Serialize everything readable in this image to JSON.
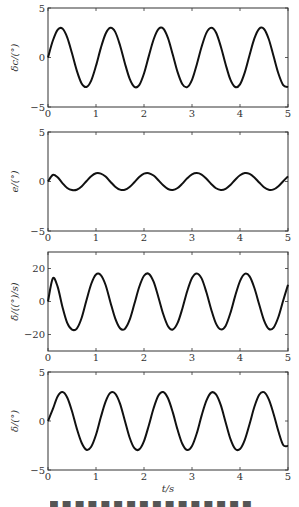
{
  "chart_data": [
    {
      "type": "line",
      "ylabel": "δc/(°)",
      "xlabel": "",
      "xlim": [
        0,
        5
      ],
      "ylim": [
        -5,
        5
      ],
      "xticks": [
        0,
        1,
        2,
        3,
        4,
        5
      ],
      "yticks": [
        -5,
        0,
        5
      ],
      "grid": false,
      "series": [
        {
          "name": "delta_c",
          "x": [
            0,
            0.1,
            0.2,
            0.3,
            0.4,
            0.5,
            0.6,
            0.7,
            0.8,
            0.9,
            1.0,
            1.1,
            1.2,
            1.3,
            1.4,
            1.5,
            1.6,
            1.7,
            1.8,
            1.9,
            2.0,
            2.1,
            2.2,
            2.3,
            2.4,
            2.5,
            2.6,
            2.7,
            2.8,
            2.9,
            3.0,
            3.1,
            3.2,
            3.3,
            3.4,
            3.5,
            3.6,
            3.7,
            3.8,
            3.9,
            4.0,
            4.1,
            4.2,
            4.3,
            4.4,
            4.5,
            4.6,
            4.7,
            4.8,
            4.9,
            5.0
          ],
          "y": [
            0,
            1.69,
            2.8,
            2.92,
            2.03,
            0.42,
            -1.33,
            -2.62,
            -2.98,
            -2.33,
            -0.84,
            0.95,
            2.4,
            3.0,
            2.59,
            1.24,
            -0.55,
            -2.13,
            -2.96,
            -2.79,
            -1.61,
            0.14,
            1.82,
            2.86,
            2.93,
            1.96,
            0.28,
            -1.48,
            -2.7,
            -2.99,
            -2.26,
            -0.7,
            1.08,
            2.49,
            3.0,
            2.52,
            1.11,
            -0.68,
            -2.24,
            -2.98,
            -2.71,
            -1.5,
            0.26,
            1.93,
            2.91,
            2.88,
            1.84,
            0.12,
            -1.62,
            -2.79,
            -2.98
          ]
        }
      ]
    },
    {
      "type": "line",
      "ylabel": "e/(°)",
      "xlabel": "",
      "xlim": [
        0,
        5
      ],
      "ylim": [
        -5,
        5
      ],
      "xticks": [
        0,
        1,
        2,
        3,
        4,
        5
      ],
      "yticks": [
        -5,
        0,
        5
      ],
      "grid": false,
      "series": [
        {
          "name": "e",
          "x": [
            0,
            0.1,
            0.2,
            0.3,
            0.4,
            0.5,
            0.6,
            0.7,
            0.8,
            0.9,
            1.0,
            1.1,
            1.2,
            1.3,
            1.4,
            1.5,
            1.6,
            1.7,
            1.8,
            1.9,
            2.0,
            2.1,
            2.2,
            2.3,
            2.4,
            2.5,
            2.6,
            2.7,
            2.8,
            2.9,
            3.0,
            3.1,
            3.2,
            3.3,
            3.4,
            3.5,
            3.6,
            3.7,
            3.8,
            3.9,
            4.0,
            4.1,
            4.2,
            4.3,
            4.4,
            4.5,
            4.6,
            4.7,
            4.8,
            4.9,
            5.0
          ],
          "y": [
            0,
            0.66,
            0.42,
            -0.16,
            -0.66,
            -0.87,
            -0.83,
            -0.5,
            0.03,
            0.54,
            0.83,
            0.8,
            0.5,
            -0.02,
            -0.52,
            -0.82,
            -0.84,
            -0.56,
            -0.07,
            0.45,
            0.79,
            0.84,
            0.6,
            0.13,
            -0.39,
            -0.76,
            -0.85,
            -0.66,
            -0.21,
            0.32,
            0.72,
            0.85,
            0.7,
            0.28,
            -0.25,
            -0.68,
            -0.85,
            -0.74,
            -0.35,
            0.18,
            0.63,
            0.85,
            0.77,
            0.41,
            -0.1,
            -0.58,
            -0.84,
            -0.8,
            -0.47,
            0.03,
            0.52
          ]
        }
      ]
    },
    {
      "type": "line",
      "ylabel": "δ̇/((°)/s)",
      "xlabel": "",
      "xlim": [
        0,
        5
      ],
      "ylim": [
        -30,
        30
      ],
      "xticks": [
        0,
        1,
        2,
        3,
        4,
        5
      ],
      "yticks": [
        -20,
        0,
        20
      ],
      "grid": false,
      "series": [
        {
          "name": "delta_dot",
          "x": [
            0,
            0.1,
            0.2,
            0.3,
            0.4,
            0.5,
            0.6,
            0.7,
            0.8,
            0.9,
            1.0,
            1.1,
            1.2,
            1.3,
            1.4,
            1.5,
            1.6,
            1.7,
            1.8,
            1.9,
            2.0,
            2.1,
            2.2,
            2.3,
            2.4,
            2.5,
            2.6,
            2.7,
            2.8,
            2.9,
            3.0,
            3.1,
            3.2,
            3.3,
            3.4,
            3.5,
            3.6,
            3.7,
            3.8,
            3.9,
            4.0,
            4.1,
            4.2,
            4.3,
            4.4,
            4.5,
            4.6,
            4.7,
            4.8,
            4.9,
            5.0
          ],
          "y": [
            0,
            14.0,
            9.0,
            -3.2,
            -13.0,
            -17.0,
            -16.4,
            -10.0,
            0.6,
            10.6,
            16.4,
            16.0,
            10.0,
            -0.4,
            -10.2,
            -16.2,
            -16.6,
            -11.2,
            -1.4,
            8.8,
            15.6,
            16.8,
            12.0,
            2.6,
            -7.6,
            -15.0,
            -17.0,
            -13.0,
            -4.2,
            6.2,
            14.2,
            17.0,
            14.0,
            5.6,
            -4.8,
            -13.4,
            -16.9,
            -14.8,
            -7.0,
            3.4,
            12.4,
            16.8,
            15.2,
            8.2,
            -1.8,
            -11.4,
            -16.6,
            -15.8,
            -9.4,
            0.6,
            10.2
          ]
        }
      ]
    },
    {
      "type": "line",
      "ylabel": "δ/(°)",
      "xlabel": "t/s",
      "xlim": [
        0,
        5
      ],
      "ylim": [
        -5,
        5
      ],
      "xticks": [
        0,
        1,
        2,
        3,
        4,
        5
      ],
      "yticks": [
        -5,
        0,
        5
      ],
      "grid": false,
      "series": [
        {
          "name": "delta",
          "x": [
            0,
            0.1,
            0.2,
            0.3,
            0.4,
            0.5,
            0.6,
            0.7,
            0.8,
            0.9,
            1.0,
            1.1,
            1.2,
            1.3,
            1.4,
            1.5,
            1.6,
            1.7,
            1.8,
            1.9,
            2.0,
            2.1,
            2.2,
            2.3,
            2.4,
            2.5,
            2.6,
            2.7,
            2.8,
            2.9,
            3.0,
            3.1,
            3.2,
            3.3,
            3.4,
            3.5,
            3.6,
            3.7,
            3.8,
            3.9,
            4.0,
            4.1,
            4.2,
            4.3,
            4.4,
            4.5,
            4.6,
            4.7,
            4.8,
            4.9,
            5.0
          ],
          "y": [
            0,
            1.2,
            2.5,
            2.95,
            2.4,
            1.0,
            -0.78,
            -2.22,
            -2.93,
            -2.62,
            -1.4,
            0.38,
            1.98,
            2.88,
            2.8,
            1.78,
            0.06,
            -1.68,
            -2.78,
            -2.9,
            -2.05,
            -0.45,
            1.3,
            2.6,
            2.96,
            2.32,
            0.88,
            -0.9,
            -2.35,
            -2.96,
            -2.55,
            -1.25,
            0.55,
            2.08,
            2.9,
            2.72,
            1.62,
            -0.12,
            -1.82,
            -2.84,
            -2.86,
            -1.92,
            -0.3,
            1.45,
            2.68,
            2.94,
            2.2,
            0.72,
            -1.05,
            -2.45,
            -2.55
          ]
        }
      ]
    }
  ],
  "axes": [
    {
      "ylabel": "δc/(°)",
      "ytick_labels": [
        "5",
        "0",
        "−5"
      ],
      "xtick_labels": [
        "0",
        "1",
        "2",
        "3",
        "4",
        "5"
      ]
    },
    {
      "ylabel": "e/(°)",
      "ytick_labels": [
        "5",
        "0",
        "−5"
      ],
      "xtick_labels": [
        "0",
        "1",
        "2",
        "3",
        "4",
        "5"
      ]
    },
    {
      "ylabel": "δ̇/((°)/s)",
      "ytick_labels": [
        "20",
        "0",
        "−20"
      ],
      "xtick_labels": [
        "0",
        "1",
        "2",
        "3",
        "4",
        "5"
      ]
    },
    {
      "ylabel": "δ/(°)",
      "ytick_labels": [
        "5",
        "0",
        "−5"
      ],
      "xtick_labels": [
        "0",
        "1",
        "2",
        "3",
        "4",
        "5"
      ]
    }
  ],
  "xlabel": "t/s"
}
